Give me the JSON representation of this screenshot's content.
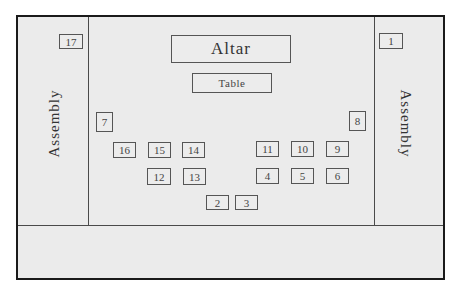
{
  "diagram": {
    "type": "seating-floor-plan",
    "zones": {
      "left_side": {
        "label": "Assembly"
      },
      "right_side": {
        "label": "Assembly"
      },
      "altar": {
        "label": "Altar"
      },
      "table": {
        "label": "Table"
      }
    },
    "seats": [
      {
        "id": "1",
        "label": "1"
      },
      {
        "id": "2",
        "label": "2"
      },
      {
        "id": "3",
        "label": "3"
      },
      {
        "id": "4",
        "label": "4"
      },
      {
        "id": "5",
        "label": "5"
      },
      {
        "id": "6",
        "label": "6"
      },
      {
        "id": "7",
        "label": "7"
      },
      {
        "id": "8",
        "label": "8"
      },
      {
        "id": "9",
        "label": "9"
      },
      {
        "id": "10",
        "label": "10"
      },
      {
        "id": "11",
        "label": "11"
      },
      {
        "id": "12",
        "label": "12"
      },
      {
        "id": "13",
        "label": "13"
      },
      {
        "id": "14",
        "label": "14"
      },
      {
        "id": "15",
        "label": "15"
      },
      {
        "id": "16",
        "label": "16"
      },
      {
        "id": "17",
        "label": "17"
      }
    ],
    "colors": {
      "background": "#ebebeb",
      "frame": "#1a1a1a",
      "lines": "#4a4a4a"
    }
  }
}
